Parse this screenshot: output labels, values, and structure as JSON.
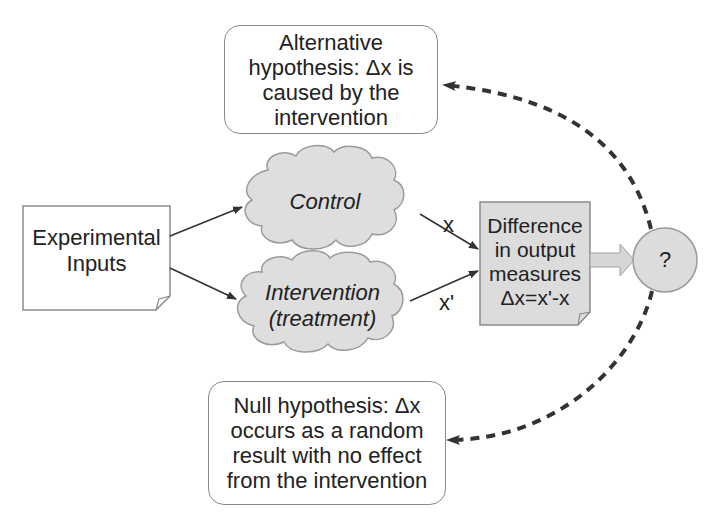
{
  "diagram": {
    "alternative_hypothesis": {
      "lines": [
        "Alternative",
        "hypothesis: Δx is",
        "caused by the",
        "intervention"
      ]
    },
    "null_hypothesis": {
      "lines": [
        "Null hypothesis: Δx",
        "occurs as a random",
        "result with no effect",
        "from the intervention"
      ]
    },
    "experimental_inputs": {
      "lines": [
        "Experimental",
        "Inputs"
      ]
    },
    "control": {
      "label": "Control"
    },
    "intervention": {
      "lines": [
        "Intervention",
        "(treatment)"
      ]
    },
    "difference": {
      "lines": [
        "Difference",
        "in output",
        "measures",
        "Δx=x'-x"
      ]
    },
    "decision": {
      "label": "?"
    },
    "edge_labels": {
      "control_output": "x",
      "intervention_output": "x'"
    }
  },
  "colors": {
    "node_fill_gray": "#dcdcdc",
    "node_border": "#8a8a8a",
    "arrow": "#333333",
    "dashed_arrow": "#333333",
    "text": "#222222",
    "background": "#ffffff"
  }
}
